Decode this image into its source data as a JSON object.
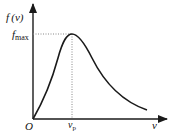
{
  "diagram": {
    "y_axis_label": "f (v)",
    "x_axis_label": "v",
    "origin_label": "O",
    "peak_y_label_main": "f",
    "peak_y_label_sub": "max",
    "peak_x_label_main": "v",
    "peak_x_label_sub": "p",
    "colors": {
      "curve": "#1a1a1a",
      "axis": "#1a1a1a",
      "guide": "#888888"
    }
  }
}
